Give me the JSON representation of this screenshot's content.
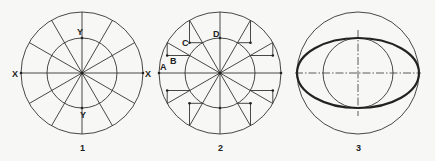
{
  "figures": [
    {
      "caption": "1",
      "labels": {
        "x_left": "X",
        "x_right": "X",
        "y_top": "Y",
        "y_bottom": "Y"
      },
      "description": "Two concentric circles divided into 12 equal sectors by radial lines"
    },
    {
      "caption": "2",
      "labels": {
        "a": "A",
        "b": "B",
        "c": "C",
        "d": "D"
      },
      "description": "Concentric circles with 12 radial lines; projection lines from outer-circle points (vertical) and inner-circle points (horizontal) intersect to plot ellipse points"
    },
    {
      "caption": "3",
      "labels": {},
      "description": "Resulting ellipse drawn through plotted points, inscribed within the major-axis circle and enclosing the minor-axis circle, with dash-dot center lines"
    }
  ],
  "colors": {
    "line": "#333333",
    "background": "#f7f7f5"
  }
}
